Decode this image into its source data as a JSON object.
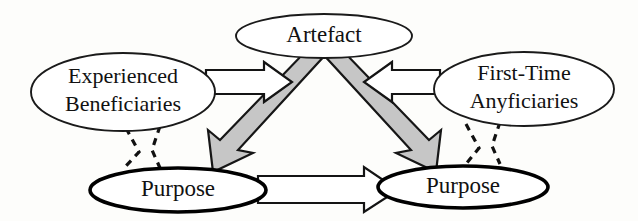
{
  "diagram": {
    "background_color": "#fdfdfb",
    "stroke_color": "#111111",
    "solid_arrow_fill": "#c6c6c6",
    "hollow_arrow_fill": "#ffffff",
    "nodes": {
      "artefact": {
        "label": "Artefact"
      },
      "experienced": {
        "label_line1": "Experienced",
        "label_line2": "Beneficiaries"
      },
      "firsttime": {
        "label_line1": "First-Time",
        "label_line2": "Anyficiaries"
      },
      "purpose_left": {
        "label": "Purpose"
      },
      "purpose_right": {
        "label": "Purpose"
      }
    },
    "edges": {
      "experienced_to_artefact": {
        "style": "hollow-block-arrow",
        "direction": "right"
      },
      "firsttime_to_artefact": {
        "style": "hollow-block-arrow",
        "direction": "left"
      },
      "artefact_to_purpose_left": {
        "style": "solid-gray-arrow",
        "direction": "down-left"
      },
      "artefact_to_purpose_right": {
        "style": "solid-gray-arrow",
        "direction": "down-right"
      },
      "purpose_left_to_purpose_right": {
        "style": "hollow-block-arrow",
        "direction": "right"
      },
      "experienced_to_purpose_left": {
        "style": "dashed-mark"
      },
      "firsttime_to_purpose_right": {
        "style": "dashed-mark"
      }
    }
  }
}
